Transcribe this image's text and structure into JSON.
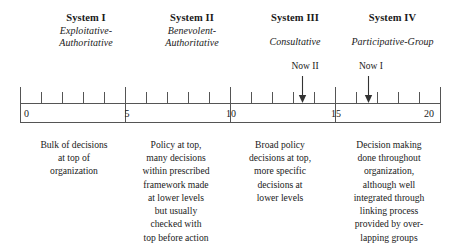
{
  "figure": {
    "title_row": [
      {
        "name": "system-1",
        "title": "System I",
        "subtitle_lines": [
          "Exploitative-",
          "Authoritative"
        ]
      },
      {
        "name": "system-2",
        "title": "System II",
        "subtitle_lines": [
          "Benevolent-",
          "Authoritative"
        ]
      },
      {
        "name": "system-3",
        "title": "System III",
        "subtitle_lines": [
          "Consultative"
        ]
      },
      {
        "name": "system-4",
        "title": "System IV",
        "subtitle_lines": [
          "Participative-Group"
        ]
      }
    ],
    "markers": [
      {
        "name": "now-2",
        "label": "Now II",
        "value": 13.4
      },
      {
        "name": "now-1",
        "label": "Now I",
        "value": 16.4
      }
    ],
    "scale": {
      "min": 0,
      "max": 20,
      "major_ticks": [
        0,
        5,
        10,
        15,
        20
      ],
      "major_labels": [
        "0",
        "5",
        "10",
        "15",
        "20"
      ],
      "minor_step": 1,
      "line_color": "#555555"
    },
    "descriptions": [
      {
        "name": "description-system-1",
        "lines": [
          "Bulk of decisions",
          "at top of",
          "organization"
        ]
      },
      {
        "name": "description-system-2",
        "lines": [
          "Policy at top,",
          "many decisions",
          "within prescribed",
          "framework made",
          "at lower levels",
          "but usually",
          "checked with",
          "top before action"
        ]
      },
      {
        "name": "description-system-3",
        "lines": [
          "Broad policy",
          "decisions at top,",
          "more specific",
          "decisions at",
          "lower levels"
        ]
      },
      {
        "name": "description-system-4",
        "lines": [
          "Decision making",
          "done throughout",
          "organization,",
          "although well",
          "integrated through",
          "linking process",
          "provided by over-",
          "lapping groups"
        ]
      }
    ]
  }
}
